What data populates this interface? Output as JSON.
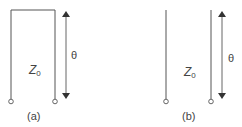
{
  "panels": [
    {
      "id": "a",
      "caption": "(a)",
      "impedance_label": "Z",
      "impedance_subscript": "0",
      "length_label": "θ",
      "termination": "short-circuit"
    },
    {
      "id": "b",
      "caption": "(b)",
      "impedance_label": "Z",
      "impedance_subscript": "0",
      "length_label": "θ",
      "termination": "open-circuit"
    }
  ],
  "colors": {
    "line": "#555555",
    "text": "#444444"
  }
}
